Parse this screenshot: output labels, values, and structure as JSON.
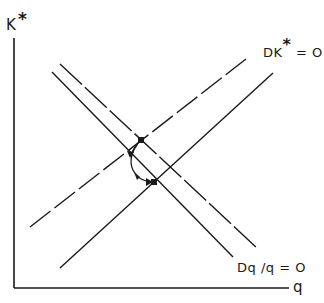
{
  "diagram": {
    "y_axis_label": "K",
    "y_axis_label_superscript": "*",
    "x_axis_label": "q",
    "curves": [
      {
        "id": "dk-star-zero",
        "label": "DK",
        "label_superscript": "*",
        "label_suffix": " = O",
        "style": "solid",
        "direction": "ascending"
      },
      {
        "id": "dk-star-shifted",
        "label": "",
        "style": "dashed",
        "direction": "ascending"
      },
      {
        "id": "dq-over-q-zero",
        "label": "Dq /q = O",
        "style": "solid",
        "direction": "descending"
      },
      {
        "id": "dq-over-q-shifted",
        "label": "",
        "style": "dashed",
        "direction": "descending"
      }
    ],
    "equilibria": [
      {
        "id": "new-equilibrium",
        "position": "upper"
      },
      {
        "id": "old-equilibrium",
        "position": "lower"
      }
    ],
    "adjustment_path": {
      "from": "new-equilibrium",
      "to": "old-equilibrium",
      "arrows": 2
    },
    "colors": {
      "ink": "#1a1a1a",
      "background": "#ffffff"
    }
  }
}
